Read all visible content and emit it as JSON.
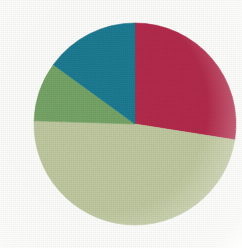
{
  "background_color": "#FDFDFB",
  "chart_data": {
    "type": "pie",
    "title": "",
    "subtitle": "",
    "xlabel": "",
    "ylabel": "",
    "grid": false,
    "legend_position": "none",
    "start_angle_deg": 0,
    "direction": "clockwise",
    "center": {
      "x": 135,
      "y": 124
    },
    "radius": 101,
    "labels": [
      "Crimson segment",
      "Pale green segment",
      "Medium green segment",
      "Teal segment"
    ],
    "values": [
      27.5,
      48.0,
      9.5,
      15.0
    ],
    "unit": "%",
    "colors": [
      "#B72B4D",
      "#C4CDA4",
      "#78A869",
      "#1B7E95"
    ],
    "slices": [
      {
        "name": "Crimson segment",
        "value": 27.5,
        "color": "#B72B4D",
        "start_angle_deg": 0,
        "end_angle_deg": 99,
        "sweep_deg": 99
      },
      {
        "name": "Pale green segment",
        "value": 48.0,
        "color": "#C4CDA4",
        "start_angle_deg": 99,
        "end_angle_deg": 271.8,
        "sweep_deg": 172.8
      },
      {
        "name": "Medium green segment",
        "value": 9.5,
        "color": "#78A869",
        "start_angle_deg": 271.8,
        "end_angle_deg": 306.0,
        "sweep_deg": 34.2
      },
      {
        "name": "Teal segment",
        "value": 15.0,
        "color": "#1B7E95",
        "start_angle_deg": 306.0,
        "end_angle_deg": 360,
        "sweep_deg": 54.0
      }
    ]
  },
  "palette": {
    "crimson": "#B72B4D",
    "pale_green": "#C4CDA4",
    "medium_green": "#78A869",
    "teal": "#1B7E95",
    "paper": "#FDFDFB"
  }
}
